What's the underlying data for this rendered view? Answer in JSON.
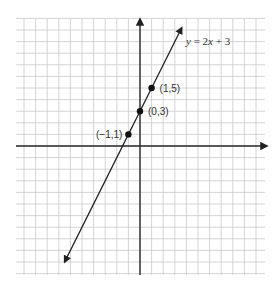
{
  "chart_data": {
    "type": "line",
    "title": "",
    "xlabel": "",
    "ylabel": "",
    "equation_label": "y = 2x + 3",
    "grid": true,
    "xlim": [
      -11,
      11
    ],
    "ylim": [
      -11,
      11
    ],
    "series": [
      {
        "name": "y = 2x + 3",
        "function": "2x + 3",
        "slope": 2,
        "intercept": 3,
        "x_range": [
          -6.5,
          3.6
        ],
        "points": [
          {
            "x": -1,
            "y": 1,
            "label": "(−1,1)"
          },
          {
            "x": 0,
            "y": 3,
            "label": "(0,3)"
          },
          {
            "x": 1,
            "y": 5,
            "label": "(1,5)"
          }
        ]
      }
    ],
    "colors": {
      "line": "#1e1e1e",
      "grid": "#c9c9c9",
      "axis": "#2a2a2a"
    }
  },
  "layout": {
    "origin_px": [
      140,
      146
    ],
    "unit_px": 11.6,
    "grid_left": 16,
    "grid_right": 265,
    "grid_top": 19,
    "grid_bottom": 275
  }
}
